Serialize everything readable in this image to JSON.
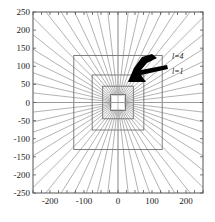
{
  "chart_data": {
    "type": "line",
    "title": "",
    "xlabel": "",
    "ylabel": "",
    "xlim": [
      -250,
      250
    ],
    "ylim": [
      -250,
      250
    ],
    "xticks": [
      -200,
      -100,
      0,
      100,
      200
    ],
    "xticklabels": [
      "-200",
      "-100",
      "0",
      "100",
      "200"
    ],
    "yticks": [
      -250,
      -200,
      -150,
      -100,
      -50,
      0,
      50,
      100,
      150,
      200,
      250
    ],
    "yticklabels": [
      "-250",
      "-200",
      "-150",
      "-100",
      "-50",
      "0",
      "50",
      "100",
      "150",
      "200",
      "250"
    ],
    "minor_xticks": [
      -250,
      -225,
      -200,
      -175,
      -150,
      -125,
      -100,
      -75,
      -50,
      -25,
      0,
      25,
      50,
      75,
      100,
      125,
      150,
      175,
      200,
      225,
      250
    ],
    "grid": false,
    "legend_position": "inside-upper-right",
    "series": [
      {
        "name": "l=1",
        "type": "square-contour",
        "half_width": 22,
        "half_height": 22
      },
      {
        "name": "l=2",
        "type": "square-contour",
        "half_width": 45,
        "half_height": 45
      },
      {
        "name": "l=3",
        "type": "square-contour",
        "half_width": 76,
        "half_height": 76
      },
      {
        "name": "l=4",
        "type": "square-contour",
        "half_width": 130,
        "half_height": 130
      }
    ],
    "radial_rays": {
      "count": 56,
      "origin": [
        0,
        0
      ],
      "color": "#808080",
      "description": "straight rays from origin extending to plot boundary"
    },
    "annotations": [
      {
        "text": "l=4",
        "x": 175,
        "y": 140,
        "style": "italic"
      },
      {
        "text": "l=1",
        "x": 175,
        "y": 78,
        "style": "italic"
      },
      {
        "text": "",
        "x": 0,
        "y": 0,
        "style": "arrow",
        "shape": "black-arrow-pointing-upper-left"
      }
    ],
    "contour_color": "#707070",
    "axis_color": "#555555",
    "background": "#ffffff"
  },
  "figure": {
    "annot_l4": "l=4",
    "annot_l1": "l=1",
    "arrow_name": "pointer-arrow"
  }
}
